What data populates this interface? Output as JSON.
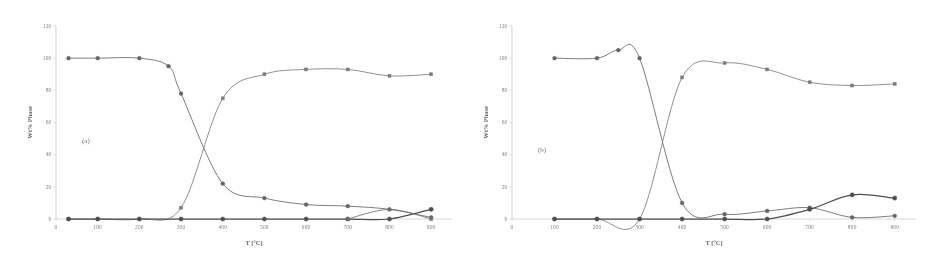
{
  "figure": {
    "background": "#ffffff",
    "ink_color": "#555555",
    "axis_color": "#c8c8c8"
  },
  "chart_data": [
    {
      "type": "line",
      "panel_label": "(a)",
      "title": "",
      "xlabel": "T [°C]",
      "ylabel": "Wt% Phase",
      "xlim": [
        0,
        950
      ],
      "ylim": [
        0,
        120
      ],
      "xticks": [
        0,
        100,
        200,
        300,
        400,
        500,
        600,
        700,
        800,
        900
      ],
      "xticklabels": [
        "0",
        "100",
        "200",
        "300",
        "400",
        "500",
        "600",
        "700",
        "800",
        "900"
      ],
      "yticks": [
        0,
        20,
        40,
        60,
        80,
        100,
        120
      ],
      "yticklabels": [
        "0",
        "20",
        "40",
        "60",
        "80",
        "100",
        "120"
      ],
      "grid": false,
      "legend": "none",
      "series": [
        {
          "name": "phase-1-descending",
          "marker": "circle",
          "color": "#4d4d4d",
          "x": [
            30,
            100,
            200,
            270,
            300,
            400,
            500,
            600,
            700,
            800,
            900
          ],
          "values": [
            100,
            100,
            100,
            95,
            78,
            22,
            13,
            9,
            8,
            6,
            1
          ]
        },
        {
          "name": "phase-2-ascending",
          "marker": "square",
          "color": "#6b6b6b",
          "x": [
            30,
            100,
            200,
            300,
            400,
            500,
            600,
            700,
            800,
            900
          ],
          "values": [
            0,
            0,
            0,
            7,
            75,
            90,
            93,
            93,
            89,
            90
          ]
        },
        {
          "name": "phase-3-baseline",
          "marker": "circle-filled",
          "color": "#2f2f2f",
          "x": [
            30,
            100,
            200,
            300,
            400,
            500,
            600,
            700,
            800,
            900
          ],
          "values": [
            0,
            0,
            0,
            0,
            0,
            0,
            0,
            0,
            0,
            6
          ]
        },
        {
          "name": "phase-4-triangle",
          "marker": "triangle",
          "color": "#5a5a5a",
          "x": [
            700,
            800,
            900
          ],
          "values": [
            0,
            6,
            0
          ]
        }
      ]
    },
    {
      "type": "line",
      "panel_label": "(b)",
      "title": "",
      "xlabel": "T [°C]",
      "ylabel": "Wt% Phase",
      "xlim": [
        0,
        950
      ],
      "ylim": [
        0,
        120
      ],
      "xticks": [
        0,
        100,
        200,
        300,
        400,
        500,
        600,
        700,
        800,
        900
      ],
      "xticklabels": [
        "0",
        "100",
        "200",
        "300",
        "400",
        "500",
        "600",
        "700",
        "800",
        "900"
      ],
      "yticks": [
        0,
        20,
        40,
        60,
        80,
        100,
        120
      ],
      "yticklabels": [
        "0",
        "20",
        "40",
        "60",
        "80",
        "100",
        "120"
      ],
      "grid": false,
      "legend": "none",
      "series": [
        {
          "name": "phase-1-descending",
          "marker": "circle",
          "color": "#4d4d4d",
          "x": [
            100,
            200,
            250,
            300,
            400,
            500,
            600,
            700,
            800,
            900
          ],
          "values": [
            100,
            100,
            105,
            100,
            10,
            3,
            5,
            7,
            1,
            2
          ]
        },
        {
          "name": "phase-2-ascending",
          "marker": "square",
          "color": "#6b6b6b",
          "x": [
            100,
            200,
            300,
            400,
            500,
            600,
            700,
            800,
            900
          ],
          "values": [
            0,
            0,
            0,
            88,
            97,
            93,
            85,
            83,
            84
          ]
        },
        {
          "name": "phase-3-baseline",
          "marker": "circle-filled",
          "color": "#2f2f2f",
          "x": [
            100,
            200,
            300,
            400,
            500,
            600,
            700,
            800,
            900
          ],
          "values": [
            0,
            0,
            0,
            0,
            0,
            0,
            6,
            15,
            13
          ]
        }
      ]
    }
  ],
  "panels": [
    {
      "id": "panel-a",
      "label": "(a)",
      "xlabel": "T [°C]",
      "ylabel": "Wt% Phase"
    },
    {
      "id": "panel-b",
      "label": "(b)",
      "xlabel": "T [°C]",
      "ylabel": "Wt% Phase"
    }
  ]
}
